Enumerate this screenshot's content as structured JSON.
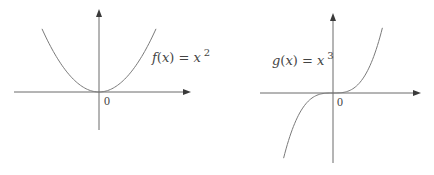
{
  "chart_data": [
    {
      "type": "line",
      "title": "",
      "function": "x^2",
      "label": {
        "name": "f",
        "var": "x",
        "equals": "=",
        "base": "x",
        "exponent": "2"
      },
      "origin_label": "0",
      "xlim": [
        -1.0,
        1.5
      ],
      "ylim": [
        -0.5,
        1.1
      ],
      "domain": [
        -0.95,
        0.95
      ],
      "axes": {
        "x_arrow": true,
        "y_arrow": true
      },
      "grid": false
    },
    {
      "type": "line",
      "title": "",
      "function": "x^3",
      "label": {
        "name": "g",
        "var": "x",
        "equals": "=",
        "base": "x",
        "exponent": "3"
      },
      "origin_label": "0",
      "xlim": [
        -1.2,
        1.4
      ],
      "ylim": [
        -1.1,
        1.2
      ],
      "domain": [
        -0.95,
        0.95
      ],
      "axes": {
        "x_arrow": true,
        "y_arrow": true
      },
      "grid": false
    }
  ]
}
